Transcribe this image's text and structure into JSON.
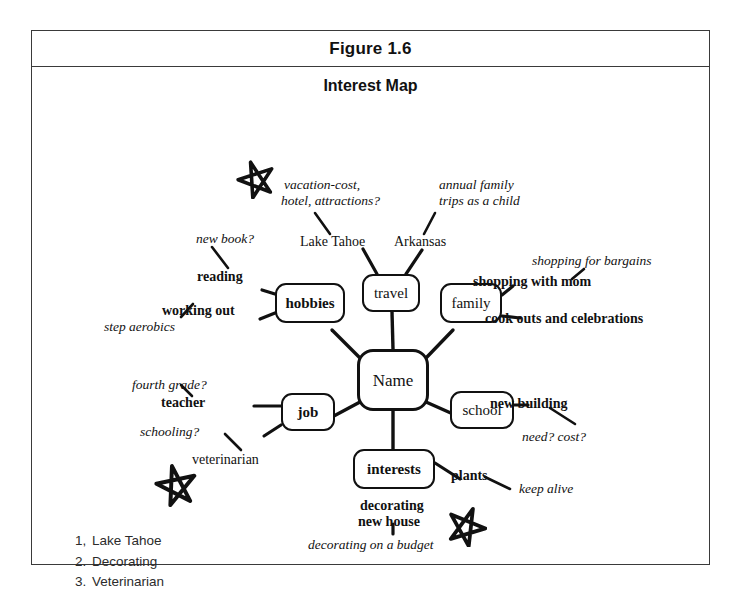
{
  "figure": {
    "caption": "Figure 1.6",
    "title": "Interest Map"
  },
  "nodes": [
    {
      "id": "name",
      "label": "Name",
      "x": 325,
      "y": 318,
      "w": 72,
      "h": 62
    },
    {
      "id": "travel",
      "label": "travel",
      "x": 330,
      "y": 243,
      "w": 58,
      "h": 38
    },
    {
      "id": "hobbies",
      "label": "hobbies",
      "x": 243,
      "y": 252,
      "w": 70,
      "h": 40
    },
    {
      "id": "family",
      "label": "family",
      "x": 408,
      "y": 252,
      "w": 62,
      "h": 40
    },
    {
      "id": "job",
      "label": "job",
      "x": 249,
      "y": 362,
      "w": 54,
      "h": 38
    },
    {
      "id": "school",
      "label": "school",
      "x": 418,
      "y": 360,
      "w": 64,
      "h": 38
    },
    {
      "id": "interests",
      "label": "interests",
      "x": 321,
      "y": 418,
      "w": 82,
      "h": 40
    }
  ],
  "labels": [
    {
      "id": "vacation-cost",
      "text": "vacation-cost,",
      "style": "italic",
      "x": 252,
      "y": 152
    },
    {
      "id": "hotel-attractions",
      "text": "hotel, attractions?",
      "style": "italic",
      "x": 249,
      "y": 168
    },
    {
      "id": "annual-family",
      "text": "annual family",
      "style": "italic",
      "x": 407,
      "y": 152
    },
    {
      "id": "trips-as-a-child",
      "text": "trips as a child",
      "style": "italic",
      "x": 407,
      "y": 168
    },
    {
      "id": "new-book",
      "text": "new book?",
      "style": "italic",
      "x": 164,
      "y": 206
    },
    {
      "id": "lake-tahoe",
      "text": "Lake Tahoe",
      "style": "roman",
      "x": 297,
      "y": 209
    },
    {
      "id": "arkansas",
      "text": "Arkansas",
      "style": "roman",
      "x": 389,
      "y": 209
    },
    {
      "id": "shopping-for-bargains",
      "text": "shopping for bargains",
      "style": "italic",
      "x": 530,
      "y": 229
    },
    {
      "id": "reading",
      "text": "reading",
      "style": "bold",
      "x": 196,
      "y": 243
    },
    {
      "id": "shopping-with-mom",
      "text": "shopping with mom",
      "style": "bold",
      "x": 472,
      "y": 249
    },
    {
      "id": "working-out",
      "text": "working out",
      "style": "bold",
      "x": 163,
      "y": 277
    },
    {
      "id": "cook-outs",
      "text": "cook outs and celebrations",
      "style": "bold",
      "x": 484,
      "y": 284
    },
    {
      "id": "step-aerobics",
      "text": "step aerobics",
      "style": "italic",
      "x": 108,
      "y": 294
    },
    {
      "id": "fourth-grade",
      "text": "fourth grade?",
      "style": "italic",
      "x": 135,
      "y": 352
    },
    {
      "id": "teacher",
      "text": "teacher",
      "style": "bold",
      "x": 162,
      "y": 369
    },
    {
      "id": "new-building",
      "text": "new building",
      "style": "bold",
      "x": 489,
      "y": 370
    },
    {
      "id": "need-cost",
      "text": "need? cost?",
      "style": "italic",
      "x": 519,
      "y": 404
    },
    {
      "id": "schooling",
      "text": "schooling?",
      "style": "italic",
      "x": 139,
      "y": 399
    },
    {
      "id": "veterinarian",
      "text": "veterinarian",
      "style": "roman",
      "x": 192,
      "y": 427
    },
    {
      "id": "plants",
      "text": "plants",
      "style": "bold",
      "x": 419,
      "y": 442
    },
    {
      "id": "keep-alive",
      "text": "keep alive",
      "style": "italic",
      "x": 518,
      "y": 456
    },
    {
      "id": "decorating",
      "text": "decorating",
      "style": "bold",
      "x": 329,
      "y": 472
    },
    {
      "id": "new-house",
      "text": "new house",
      "style": "bold",
      "x": 331,
      "y": 487
    },
    {
      "id": "decorating-on-budget",
      "text": "decorating on a budget",
      "style": "italic",
      "x": 278,
      "y": 512
    }
  ],
  "stars": [
    {
      "id": "star-top",
      "x": 204,
      "y": 128,
      "size": 40,
      "rotate": -18
    },
    {
      "id": "star-left",
      "x": 122,
      "y": 432,
      "size": 44,
      "rotate": -12
    },
    {
      "id": "star-bottom",
      "x": 413,
      "y": 474,
      "size": 42,
      "rotate": 22
    }
  ],
  "legend": {
    "items": [
      {
        "num": "1,",
        "text": "Lake Tahoe"
      },
      {
        "num": "2.",
        "text": "Decorating"
      },
      {
        "num": "3.",
        "text": "Veterinarian"
      }
    ]
  },
  "colors": {
    "ink": "#111111",
    "frame": "#3a3a3a",
    "legend_text": "#2b2b2b",
    "background": "#ffffff"
  }
}
